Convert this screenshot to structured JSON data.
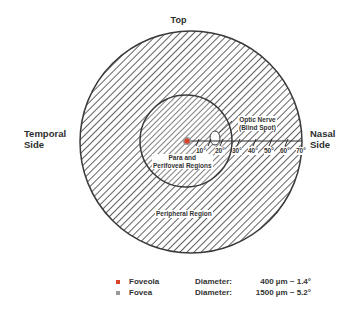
{
  "orientation": {
    "top": "Top",
    "temporal": [
      "Temporal",
      "Side"
    ],
    "nasal": [
      "Nasal",
      "Side"
    ]
  },
  "regions": {
    "optic_nerve": [
      "Optic Nerve",
      "(Blind Spot)"
    ],
    "para_perifoveal": [
      "Para and",
      "Perifoveal Regions"
    ],
    "peripheral": "Peripheral Region"
  },
  "scale_ticks": [
    "10°",
    "20°",
    "30°",
    "40°",
    "50°",
    "60°",
    "70°"
  ],
  "legend": [
    {
      "name": "Foveola",
      "diameter_label": "Diameter:",
      "value": "400 µm ~ 1.4°",
      "color": "#d9432b"
    },
    {
      "name": "Fovea",
      "diameter_label": "Diameter:",
      "value": "1500 µm ~ 5.2°",
      "color": "#9a9a9a"
    }
  ],
  "colors": {
    "hatch": "#3a3a3a",
    "foveola": "#d9432b",
    "fovea": "#9a9a9a"
  }
}
